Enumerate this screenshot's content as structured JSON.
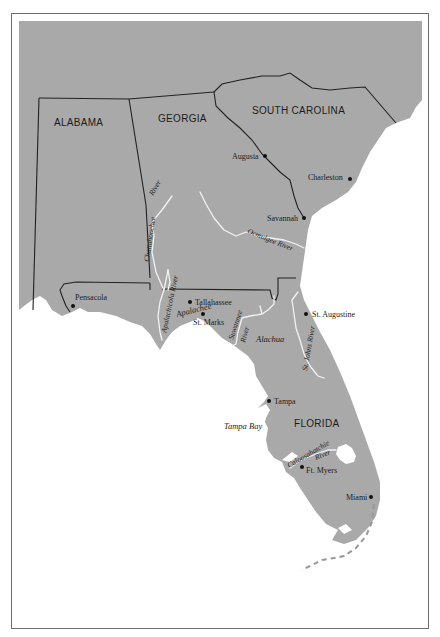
{
  "map": {
    "states": [
      {
        "name": "ALABAMA",
        "x": 54,
        "y": 126
      },
      {
        "name": "GEORGIA",
        "x": 158,
        "y": 122
      },
      {
        "name": "SOUTH CAROLINA",
        "x": 252,
        "y": 114
      },
      {
        "name": "FLORIDA",
        "x": 294,
        "y": 427
      }
    ],
    "cities": [
      {
        "name": "Augusta",
        "dot_x": 265,
        "dot_y": 156,
        "label_x": 232,
        "label_y": 159
      },
      {
        "name": "Charleston",
        "dot_x": 350,
        "dot_y": 179,
        "label_x": 308,
        "label_y": 180
      },
      {
        "name": "Savannah",
        "dot_x": 304,
        "dot_y": 218,
        "label_x": 267,
        "label_y": 221
      },
      {
        "name": "Pensacola",
        "dot_x": 73,
        "dot_y": 306,
        "label_x": 75,
        "label_y": 300
      },
      {
        "name": "Tallahassee",
        "dot_x": 190,
        "dot_y": 302,
        "label_x": 195,
        "label_y": 305
      },
      {
        "name": "St. Marks",
        "dot_x": 203,
        "dot_y": 314,
        "label_x": 193,
        "label_y": 325
      },
      {
        "name": "St. Augustine",
        "dot_x": 306,
        "dot_y": 314,
        "label_x": 312,
        "label_y": 317
      },
      {
        "name": "Tampa",
        "dot_x": 269,
        "dot_y": 401,
        "label_x": 274,
        "label_y": 404
      },
      {
        "name": "Ft. Myers",
        "dot_x": 302,
        "dot_y": 467,
        "label_x": 306,
        "label_y": 473
      },
      {
        "name": "Miami",
        "dot_x": 371,
        "dot_y": 497,
        "label_x": 346,
        "label_y": 500
      }
    ],
    "rivers": [
      {
        "name": "River",
        "sub": "Chattahoochee (upper)",
        "x": 153,
        "y": 196,
        "rotate": -60
      },
      {
        "name": "Chattahoochee",
        "x": 149,
        "y": 262,
        "rotate": -82
      },
      {
        "name": "Apalachicola River",
        "x": 166,
        "y": 333,
        "rotate": -78
      },
      {
        "name": "Ocmulgee River",
        "x": 247,
        "y": 233,
        "rotate": 22
      },
      {
        "name": "Suwannee",
        "x": 233,
        "y": 340,
        "rotate": -72
      },
      {
        "name": "River",
        "sub": "Suwannee",
        "x": 245,
        "y": 343,
        "rotate": -75
      },
      {
        "name": "St. Johns River",
        "x": 307,
        "y": 371,
        "rotate": -80
      },
      {
        "name": "Caloosahatchie",
        "x": 289,
        "y": 468,
        "rotate": -30
      },
      {
        "name": "River",
        "sub": "Caloosahatchie",
        "x": 316,
        "y": 460,
        "rotate": -22
      }
    ],
    "regions": [
      {
        "name": "Apalachee",
        "x": 177,
        "y": 317,
        "rotate": -14
      },
      {
        "name": "Alachua",
        "x": 256,
        "y": 342,
        "rotate": 0
      },
      {
        "name": "Tampa Bay",
        "x": 224,
        "y": 429,
        "rotate": 0
      }
    ]
  },
  "colors": {
    "land": "#a9a9a9",
    "water": "#ffffff",
    "border": "#222222",
    "river": "#f2f2f2"
  }
}
